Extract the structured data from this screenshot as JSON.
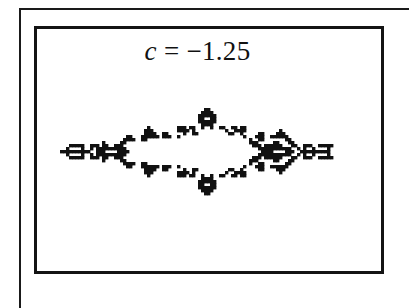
{
  "figure": {
    "title_var": "c",
    "title_eq": " = ",
    "title_value": "−1.25"
  },
  "colors": {
    "ink": "#111111",
    "background": "#ffffff"
  },
  "fractal": {
    "origin_x": 60,
    "origin_y": 105,
    "cell": 3,
    "rows": [
      "....................................................................................................",
      "................................................##..................................................",
      "...............................................####.................................................",
      "..............................................######................................................",
      "..............................................##..##................................................",
      "..............................................######................................................",
      "...............................................####.................................................",
      ".............................#.........###.##..#..#..##..##.##......................................",
      "............................###........####.#..........#..####...........#.........................",
      "............................####..##.....#..##..........##..#.....##....###.........................",
      "......................##...######.###..#.....................#...###..######........................",
      ".....................####..##..................................#..##.......##.......................",
      "..............#.....##.........................................###.....##...##.....................",
      "...#####..###.##..###...........................................###.######...##..###..#####........",
      "..#....#..#.##########............................................###########..#.#..#....#.........",
      "##########..###....####............................................####....###..##########.........",
      "..#....#..#.##########............................................###########..#.#..#....#.........",
      "...#####..###.##..###...........................................###.######...##..###..#####........",
      "..............#.....##.........................................###.....##...##.....................",
      ".....................####..##..................................#..##.......##.......................",
      "......................##...######.###..#.....................#...###..######........................",
      "............................####..##.....#..##..........##..#.....##....###.........................",
      "............................###........####.#..........#..####...........#.........................",
      ".............................#.........###.##..#..#..##..##.##......................................",
      "...............................................####.................................................",
      "..............................................######................................................",
      "..............................................##..##................................................",
      "..............................................######................................................",
      "...............................................####.................................................",
      "................................................##.................................................."
    ]
  }
}
